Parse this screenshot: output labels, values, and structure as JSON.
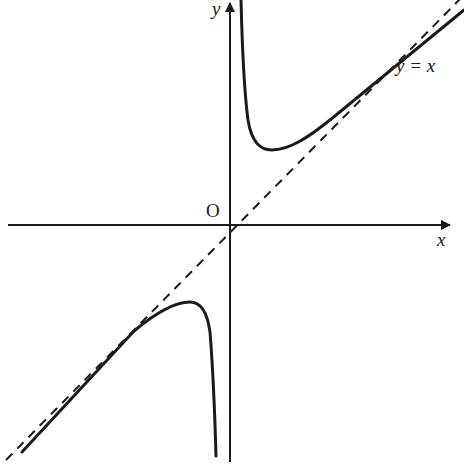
{
  "diagram": {
    "title": "",
    "labels": {
      "origin": "O",
      "x_axis": "x",
      "y_axis": "y",
      "asymptote": "y = x"
    },
    "elements": [
      {
        "name": "x-axis",
        "type": "arrow",
        "description": "horizontal axis with arrowhead pointing right"
      },
      {
        "name": "y-axis",
        "type": "arrow",
        "description": "vertical axis with arrowhead pointing up"
      },
      {
        "name": "asymptote-y-equals-x",
        "type": "dashed-line",
        "description": "oblique asymptote y = x through origin"
      },
      {
        "name": "curve-upper-branch",
        "type": "curve",
        "description": "branch in first quadrant, vertical asymptote at y-axis, local minimum, approaching y = x from above"
      },
      {
        "name": "curve-lower-branch",
        "type": "curve",
        "description": "branch in third quadrant, vertical asymptote at y-axis, local maximum, approaching y = x from below"
      }
    ],
    "colors": {
      "stroke": "#1a1a1a",
      "background": "#ffffff"
    }
  }
}
